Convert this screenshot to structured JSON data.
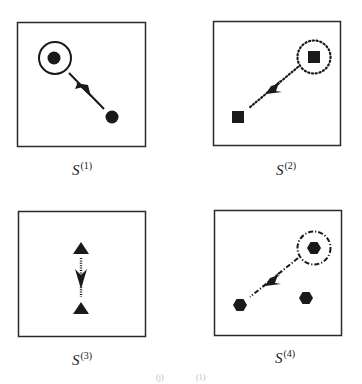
{
  "panels": [
    {
      "id": "S1",
      "label_base": "S",
      "label_sup": "(1)",
      "marker_shape": "circle",
      "selection_ring_style": "solid",
      "arrow_line_style": "solid",
      "arrow_direction": "down-right"
    },
    {
      "id": "S2",
      "label_base": "S",
      "label_sup": "(2)",
      "marker_shape": "square",
      "selection_ring_style": "dotted",
      "arrow_line_style": "dotted",
      "arrow_direction": "down-left"
    },
    {
      "id": "S3",
      "label_base": "S",
      "label_sup": "(3)",
      "marker_shape": "triangle",
      "selection_ring_style": "none",
      "arrow_line_style": "dashed",
      "arrow_direction": "down"
    },
    {
      "id": "S4",
      "label_base": "S",
      "label_sup": "(4)",
      "marker_shape": "hexagon",
      "selection_ring_style": "dash-dot",
      "arrow_line_style": "dash-dot",
      "arrow_direction": "down-left"
    }
  ],
  "caption_fragment": {
    "left": "(j)",
    "right": "(1)"
  },
  "colors": {
    "ink": "#1a1a1a",
    "frame": "#2a2a2a",
    "background": "#ffffff"
  }
}
